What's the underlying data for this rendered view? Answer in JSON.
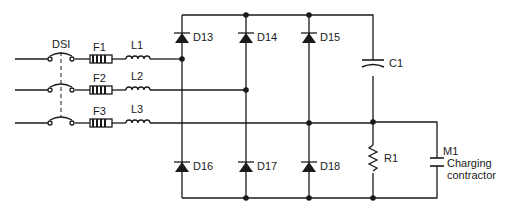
{
  "diagram": {
    "switch": {
      "label": "DSI"
    },
    "fuses": [
      {
        "label": "F1"
      },
      {
        "label": "F2"
      },
      {
        "label": "F3"
      }
    ],
    "inductors": [
      {
        "label": "L1"
      },
      {
        "label": "L2"
      },
      {
        "label": "L3"
      }
    ],
    "diodes_upper": [
      {
        "label": "D13"
      },
      {
        "label": "D14"
      },
      {
        "label": "D15"
      }
    ],
    "diodes_lower": [
      {
        "label": "D16"
      },
      {
        "label": "D17"
      },
      {
        "label": "D18"
      }
    ],
    "capacitor": {
      "label": "C1"
    },
    "resistor": {
      "label": "R1"
    },
    "contactor": {
      "label": "M1",
      "desc_line1": "Charging",
      "desc_line2": "contractor"
    }
  }
}
